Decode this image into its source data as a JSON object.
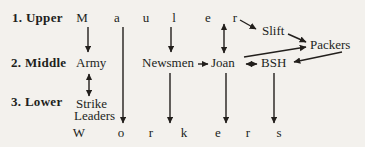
{
  "colors": {
    "background": "#f3f1ed",
    "ink": "#221f1c"
  },
  "row_labels": [
    {
      "label": "1. Upper"
    },
    {
      "label": "2. Middle"
    },
    {
      "label": "3. Lower"
    }
  ],
  "upper_word": {
    "word": "Mauler",
    "letters": [
      "M",
      "a",
      "u",
      "l",
      "e",
      "r"
    ]
  },
  "middle_nodes": {
    "army": "Army",
    "newsmen": "Newsmen",
    "joan": "Joan",
    "bsh": "BSH"
  },
  "upper_right_nodes": {
    "slift": "Slift",
    "packers": "Packers"
  },
  "lower_nodes": {
    "strike_leaders_line1": "Strike",
    "strike_leaders_line2": "Leaders"
  },
  "workers_word": {
    "word": "Workers",
    "letters": [
      "W",
      "o",
      "r",
      "k",
      "e",
      "r",
      "s"
    ]
  },
  "edges": [
    {
      "name": "mauler-m-to-army",
      "from": "Mauler (M)",
      "to": "Army",
      "heads": "end",
      "x1": 88,
      "y1": 27,
      "x2": 88,
      "y2": 52
    },
    {
      "name": "mauler-a-to-workers-o",
      "from": "Mauler (a)",
      "to": "Workers (o)",
      "heads": "end",
      "x1": 123,
      "y1": 27,
      "x2": 123,
      "y2": 123
    },
    {
      "name": "mauler-l-to-newsmen",
      "from": "Mauler (l)",
      "to": "Newsmen",
      "heads": "end",
      "x1": 171,
      "y1": 27,
      "x2": 171,
      "y2": 52
    },
    {
      "name": "mauler-e-joan-bidirectional",
      "from": "Mauler (e)",
      "to": "Joan",
      "heads": "both",
      "x1": 224,
      "y1": 24,
      "x2": 224,
      "y2": 53
    },
    {
      "name": "mauler-r-to-slift",
      "from": "Mauler (r)",
      "to": "Slift",
      "heads": "end",
      "x1": 240,
      "y1": 20,
      "x2": 256,
      "y2": 29
    },
    {
      "name": "slift-to-packers",
      "from": "Slift",
      "to": "Packers",
      "heads": "end",
      "x1": 288,
      "y1": 34,
      "x2": 306,
      "y2": 42
    },
    {
      "name": "joan-to-packers",
      "from": "Joan",
      "to": "Packers",
      "heads": "end",
      "x1": 244,
      "y1": 57,
      "x2": 306,
      "y2": 47
    },
    {
      "name": "packers-to-bsh",
      "from": "Packers",
      "to": "BSH",
      "heads": "end",
      "x1": 342,
      "y1": 52,
      "x2": 294,
      "y2": 62
    },
    {
      "name": "newsmen-to-joan",
      "from": "Newsmen",
      "to": "Joan",
      "heads": "end",
      "x1": 198,
      "y1": 64,
      "x2": 208,
      "y2": 64
    },
    {
      "name": "joan-bsh-bidirectional",
      "from": "Joan",
      "to": "BSH",
      "heads": "both",
      "x1": 246,
      "y1": 64,
      "x2": 257,
      "y2": 64
    },
    {
      "name": "army-strike-leaders-bidirectional",
      "from": "Army",
      "to": "Strike Leaders",
      "heads": "both",
      "x1": 89,
      "y1": 74,
      "x2": 89,
      "y2": 96
    },
    {
      "name": "newsmen-to-workers-k",
      "from": "Newsmen",
      "to": "Workers (k)",
      "heads": "end",
      "x1": 170,
      "y1": 73,
      "x2": 170,
      "y2": 123
    },
    {
      "name": "joan-to-workers-e",
      "from": "Joan",
      "to": "Workers (e)",
      "heads": "end",
      "x1": 226,
      "y1": 73,
      "x2": 226,
      "y2": 123
    },
    {
      "name": "bsh-to-workers-s",
      "from": "BSH",
      "to": "Workers (s)",
      "heads": "end",
      "x1": 274,
      "y1": 73,
      "x2": 274,
      "y2": 123
    }
  ]
}
